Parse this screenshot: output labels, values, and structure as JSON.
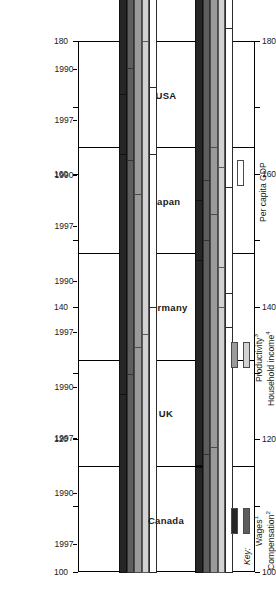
{
  "chart_data": {
    "type": "bar",
    "title": "",
    "orientation": "horizontal-rotated",
    "xlabel": "",
    "ylabel": "",
    "axis_range": [
      180,
      100
    ],
    "axis_ticks": [
      180,
      170,
      160,
      150,
      140,
      130,
      120,
      110,
      100
    ],
    "axis_tick_labels": [
      "180",
      "160",
      "140",
      "120",
      "100"
    ],
    "axis_labelled_ticks": [
      180,
      160,
      140,
      120,
      100
    ],
    "baseline": 100,
    "grid": false,
    "legend_position": "right",
    "categories": [
      "USA",
      "Japan",
      "Germany",
      "UK",
      "Canada"
    ],
    "subcategories": [
      "1990",
      "1997"
    ],
    "series": [
      {
        "name": "Wages",
        "values": {
          "USA": {
            "1990": 100.5,
            "1997": 104.0
          },
          "Japan": {
            "1990": 148.0,
            "1997": 156.0
          },
          "Germany": {
            "1990": 124.0,
            "1997": 140.0
          },
          "UK": {
            "1990": 131.0,
            "1997": 147.0
          },
          "Canada": {
            "1990": 116.0,
            "1997": 127.0
          }
        }
      },
      {
        "name": "Compensation",
        "values": {
          "USA": {
            "1990": 108.0,
            "1997": 114.0
          },
          "Japan": {
            "1990": 152.0,
            "1997": 150.0
          },
          "Germany": {
            "1990": 127.0,
            "1997": 144.0
          },
          "UK": {
            "1990": 134.0,
            "1997": 146.0
          },
          "Canada": {
            "1990": 118.0,
            "1997": 130.0
          }
        }
      },
      {
        "name": "Productivity",
        "values": {
          "USA": {
            "1990": 111.0,
            "1997": 123.0
          },
          "Japan": {
            "1990": 155.0,
            "1997": 157.0
          },
          "Germany": {
            "1990": 132.0,
            "1997": 155.0
          },
          "UK": {
            "1990": 138.0,
            "1997": 141.0
          },
          "Canada": {
            "1990": 119.0,
            "1997": 134.0
          }
        }
      },
      {
        "name": "Household income",
        "values": {
          "USA": {
            "1990": 134.0,
            "1997": 146.0
          },
          "Japan": {
            "1990": 140.0,
            "1997": 152.0
          },
          "Germany": {
            "1990": 129.0,
            "1997": 142.0
          },
          "UK": {
            "1990": 130.0,
            "1997": 164.0
          },
          "Canada": {
            "1990": 140.0,
            "1997": 136.0
          }
        }
      },
      {
        "name": "Per capita GDP",
        "values": {
          "USA": {
            "1990": 132.0,
            "1997": 147.0
          },
          "Japan": {
            "1990": 134.0,
            "1997": 156.0
          },
          "Germany": {
            "1990": 126.0,
            "1997": 141.0
          },
          "UK": {
            "1990": 126.0,
            "1997": 147.0
          },
          "Canada": {
            "1990": 137.0,
            "1997": 140.0
          }
        }
      }
    ]
  },
  "axis": {
    "labels": [
      "180",
      "160",
      "140",
      "120",
      "100"
    ]
  },
  "panels": [
    {
      "name": "USA",
      "years": [
        "1990",
        "1997"
      ]
    },
    {
      "name": "Japan",
      "years": [
        "1990",
        "1997"
      ]
    },
    {
      "name": "Germany",
      "years": [
        "1990",
        "1997"
      ]
    },
    {
      "name": "UK",
      "years": [
        "1990",
        "1997"
      ]
    },
    {
      "name": "Canada",
      "years": [
        "1990",
        "1997"
      ]
    }
  ],
  "key": {
    "title": "Key:",
    "items": [
      {
        "label": "Wages",
        "note": "1",
        "color": "#262626"
      },
      {
        "label": "Compensation",
        "note": "2",
        "color": "#5e5e5e"
      },
      {
        "label": "Productivity",
        "note": "3",
        "color": "#9a9a9a"
      },
      {
        "label": "Household income",
        "note": "4",
        "color": "#d2d2d2"
      },
      {
        "label": "Per capita GDP",
        "note": "",
        "color": "#ffffff"
      }
    ]
  }
}
